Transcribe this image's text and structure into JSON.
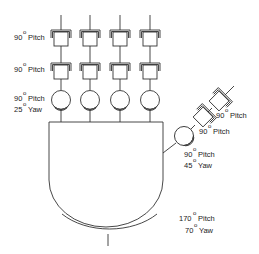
{
  "diagram": {
    "colors": {
      "stroke": "#333333",
      "text": "#222222",
      "background": "#ffffff"
    },
    "degree_symbol": "o",
    "fingers": {
      "count": 4,
      "labels": {
        "joint1": {
          "angle": "90",
          "axis": "Pitch"
        },
        "joint2": {
          "angle": "90",
          "axis": "Pitch"
        },
        "joint3_pitch": {
          "angle": "90",
          "axis": "Pitch"
        },
        "joint3_yaw": {
          "angle": "25",
          "axis": "Yaw"
        }
      }
    },
    "thumb": {
      "labels": {
        "joint1": {
          "angle": "90",
          "axis": "Pitch"
        },
        "joint2": {
          "angle": "90",
          "axis": "Pitch"
        },
        "joint3_pitch": {
          "angle": "90",
          "axis": "Pitch"
        },
        "joint3_yaw": {
          "angle": "45",
          "axis": "Yaw"
        }
      }
    },
    "wrist": {
      "labels": {
        "pitch": {
          "angle": "170",
          "axis": "Pitch"
        },
        "yaw": {
          "angle": "70",
          "axis": "Yaw"
        }
      }
    }
  }
}
